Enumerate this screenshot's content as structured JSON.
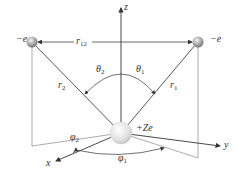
{
  "diagram": {
    "type": "helium-like atom coordinate geometry",
    "electron_left": {
      "label": "−e"
    },
    "electron_right": {
      "label": "−e"
    },
    "nucleus": {
      "label": "+Ze"
    },
    "separation": {
      "label": "r",
      "sub": "12"
    },
    "radius_left": {
      "label": "r",
      "sub": "2"
    },
    "radius_right": {
      "label": "r",
      "sub": "1"
    },
    "theta_left": {
      "label": "θ",
      "sub": "2"
    },
    "theta_right": {
      "label": "θ",
      "sub": "1"
    },
    "phi_left": {
      "label": "φ",
      "sub": "2"
    },
    "phi_right": {
      "label": "φ",
      "sub": "1"
    },
    "axes": {
      "x": "x",
      "y": "y",
      "z": "z"
    },
    "colors": {
      "line": "#555555",
      "sphere": "#bbbbbb",
      "nucleus": "#dddddd"
    }
  }
}
